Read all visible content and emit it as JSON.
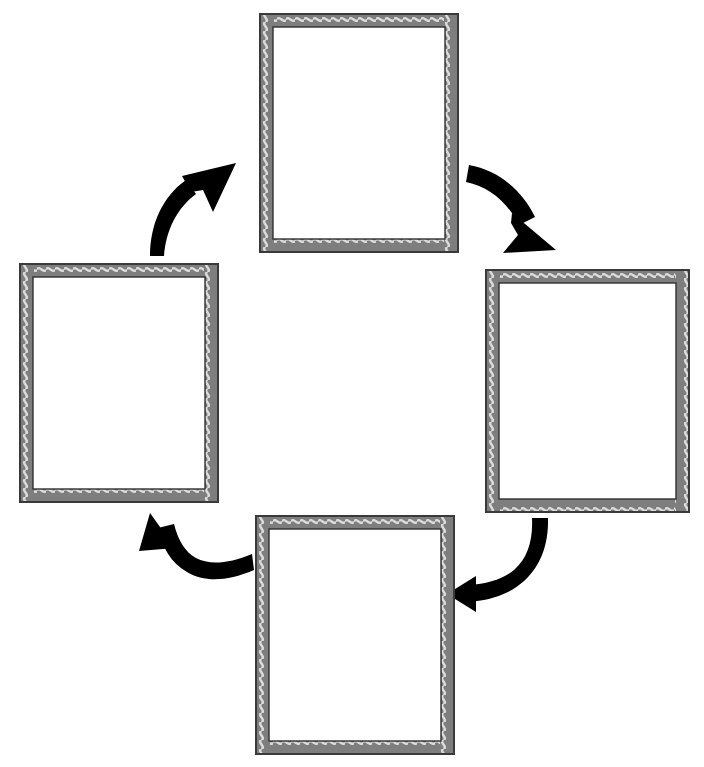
{
  "page": {
    "background_color": "#ffffff",
    "width": 704,
    "height": 767
  },
  "footer": {
    "copyright": "1 Copyright © Pearson Education, Inc., or its affiliates. All Rights Reserved.",
    "orientation": "vertical-right-edge"
  },
  "diagram": {
    "type": "cycle",
    "direction": "clockwise",
    "node_count": 4,
    "arrow_count": 4,
    "frame_style": "wavy-gray-double-border",
    "frame_colors": {
      "outer_dark": "#3a3a3a",
      "body_gray": "#7e7e7e",
      "wave_light": "#d8d8d8",
      "inner_fill": "#ffffff"
    },
    "arrow_color": "#000000",
    "nodes": [
      {
        "id": "node-top",
        "position": "top",
        "label": "",
        "x": 259,
        "y": 13,
        "width": 200,
        "height": 240
      },
      {
        "id": "node-right",
        "position": "right",
        "label": "",
        "x": 485,
        "y": 269,
        "width": 205,
        "height": 244
      },
      {
        "id": "node-bottom",
        "position": "bottom",
        "label": "",
        "x": 255,
        "y": 515,
        "width": 200,
        "height": 240
      },
      {
        "id": "node-left",
        "position": "left",
        "label": "",
        "x": 19,
        "y": 263,
        "width": 200,
        "height": 240
      }
    ],
    "arrows": [
      {
        "id": "arrow-left-to-top",
        "from": "node-left",
        "to": "node-top",
        "direction": "up-right"
      },
      {
        "id": "arrow-top-to-right",
        "from": "node-top",
        "to": "node-right",
        "direction": "down-right"
      },
      {
        "id": "arrow-right-to-bottom",
        "from": "node-right",
        "to": "node-bottom",
        "direction": "down-left"
      },
      {
        "id": "arrow-bottom-to-left",
        "from": "node-bottom",
        "to": "node-left",
        "direction": "up-left"
      }
    ]
  }
}
